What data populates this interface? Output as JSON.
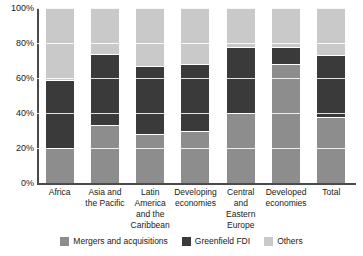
{
  "chart_data": {
    "type": "bar",
    "stacked": true,
    "stack_total": 100,
    "title": "",
    "subtitle": "",
    "xlabel": "",
    "ylabel": "",
    "ylim": [
      0,
      100
    ],
    "yticks": [
      "0%",
      "20%",
      "40%",
      "60%",
      "80%",
      "100%"
    ],
    "ytick_values": [
      0,
      20,
      40,
      60,
      80,
      100
    ],
    "grid": true,
    "grid_orientation": "horizontal",
    "legend_position": "bottom",
    "categories": [
      "Africa",
      "Asia and the Pacific",
      "Latin America and the Caribbean",
      "Developing economies",
      "Central and Eastern Europe",
      "Developed economies",
      "Total"
    ],
    "series": [
      {
        "name": "Mergers and acquisitions",
        "color": "#8d8d8d",
        "values": [
          20,
          33,
          28,
          30,
          40,
          68,
          38
        ]
      },
      {
        "name": "Greenfield FDI",
        "color": "#3a3a3a",
        "values": [
          39,
          41,
          39,
          38,
          38,
          10,
          35
        ]
      },
      {
        "name": "Others",
        "color": "#c9c9c9",
        "values": [
          41,
          26,
          33,
          32,
          22,
          22,
          27
        ]
      }
    ]
  },
  "axis": {
    "y_tick_labels": [
      "100%",
      "80%",
      "60%",
      "40%",
      "20%",
      "0%"
    ]
  },
  "legend": {
    "items": [
      {
        "label": "Mergers and acquisitions",
        "color": "#8d8d8d"
      },
      {
        "label": "Greenfield FDI",
        "color": "#3a3a3a"
      },
      {
        "label": "Others",
        "color": "#c9c9c9"
      }
    ]
  },
  "colors": {
    "mergers_and_acquisitions": "#8d8d8d",
    "greenfield_fdi": "#3a3a3a",
    "others": "#c9c9c9",
    "axis": "#4a4a4a",
    "gridline": "#ffffff",
    "background": "#ffffff",
    "text": "#1a1a1a"
  }
}
